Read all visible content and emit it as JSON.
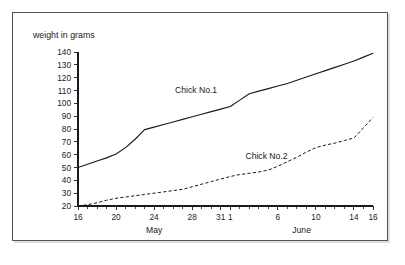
{
  "figure": {
    "frame_border_color": "#555555",
    "background_color": "#ffffff",
    "line_color": "#1a1a1a"
  },
  "chart_data": {
    "type": "line",
    "title": "",
    "ylabel": "weight in grams",
    "xlabel": "",
    "ylim": [
      20,
      140
    ],
    "y_ticks": [
      20,
      30,
      40,
      50,
      60,
      70,
      80,
      90,
      100,
      110,
      120,
      130,
      140
    ],
    "y_tick_labels": [
      "20",
      "30",
      "40",
      "50",
      "60",
      "70",
      "80",
      "90",
      "100",
      "110",
      "120",
      "130",
      "140"
    ],
    "xlim": [
      0,
      31
    ],
    "x_tick_positions": [
      0,
      4,
      8,
      12,
      15,
      16,
      21,
      25,
      29,
      31
    ],
    "x_tick_labels": [
      "16",
      "20",
      "24",
      "28",
      "31",
      "1",
      "6",
      "10",
      "14",
      "16"
    ],
    "x_minor_tick_positions": [
      1,
      2,
      3,
      5,
      6,
      7,
      9,
      10,
      11,
      13,
      14,
      17,
      18,
      19,
      20,
      22,
      23,
      24,
      26,
      27,
      28,
      30
    ],
    "month_groups": [
      {
        "label": "May",
        "center_position": 8
      },
      {
        "label": "June",
        "center_position": 23.5
      }
    ],
    "grid": false,
    "legend_position": "inline-annotation",
    "series": [
      {
        "name": "Chick No.1",
        "style": "solid",
        "label_position": {
          "x": 10.2,
          "y": 108
        },
        "x": [
          0,
          1,
          2,
          3,
          4,
          5,
          6,
          7,
          8,
          9,
          10,
          11,
          12,
          13,
          14,
          15,
          16,
          17,
          18,
          19,
          20,
          21,
          22,
          23,
          24,
          25,
          26,
          27,
          28,
          29,
          30,
          31
        ],
        "values": [
          50,
          52.5,
          55,
          57.5,
          60.5,
          65.5,
          72,
          79.5,
          81.5,
          83.5,
          85.5,
          87.5,
          89.5,
          91.5,
          93.5,
          95.5,
          97.5,
          102.5,
          107.5,
          109.5,
          111.5,
          113.5,
          115.5,
          118,
          120.5,
          123,
          125.5,
          128,
          130.5,
          133,
          136,
          139
        ]
      },
      {
        "name": "Chick No.2",
        "style": "dashed",
        "label_position": {
          "x": 17.6,
          "y": 57
        },
        "x": [
          0,
          1,
          2,
          3,
          4,
          5,
          6,
          7,
          8,
          9,
          10,
          11,
          12,
          13,
          14,
          15,
          16,
          17,
          18,
          19,
          20,
          21,
          22,
          23,
          24,
          25,
          26,
          27,
          28,
          29,
          30,
          31
        ],
        "values": [
          20,
          21,
          22.5,
          24.5,
          26,
          27,
          28,
          29,
          30,
          31,
          32,
          33,
          35,
          37,
          39,
          41,
          43,
          44.5,
          45.5,
          46.5,
          48,
          51,
          54.5,
          58,
          62,
          65.5,
          67.5,
          69,
          71,
          73,
          81,
          89
        ]
      }
    ]
  }
}
